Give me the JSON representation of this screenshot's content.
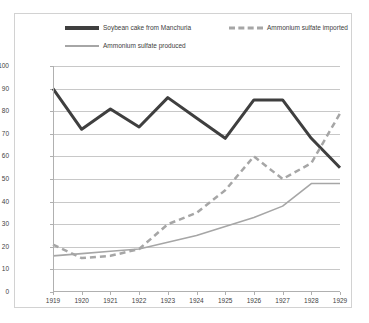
{
  "legend": {
    "entries": [
      {
        "label": "Soybean cake from Manchuria",
        "style": "solid-dark",
        "color": "#3f3f3f"
      },
      {
        "label": "Ammonium sulfate imported",
        "style": "dashed-gray",
        "color": "#a6a6a6"
      },
      {
        "label": "Ammonium sulfate produced",
        "style": "solid-gray",
        "color": "#a6a6a6"
      }
    ]
  },
  "chart_data": {
    "type": "line",
    "title": "",
    "xlabel": "",
    "ylabel": "",
    "categories": [
      "1919",
      "1920",
      "1921",
      "1922",
      "1923",
      "1924",
      "1925",
      "1926",
      "1927",
      "1928",
      "1929"
    ],
    "ylim": [
      0,
      100
    ],
    "yticks": [
      0,
      10,
      20,
      30,
      40,
      50,
      60,
      70,
      80,
      90,
      100
    ],
    "grid": true,
    "legend_position": "top",
    "series": [
      {
        "name": "Soybean cake from Manchuria",
        "color": "#3f3f3f",
        "style": "solid",
        "width": 3,
        "values": [
          90,
          72,
          81,
          73,
          86,
          77,
          68,
          85,
          85,
          68,
          55
        ]
      },
      {
        "name": "Ammonium sulfate imported",
        "color": "#a6a6a6",
        "style": "dashed",
        "width": 2.5,
        "values": [
          21,
          15,
          16,
          19,
          30,
          35,
          45,
          60,
          50,
          57,
          79
        ]
      },
      {
        "name": "Ammonium sulfate produced",
        "color": "#a6a6a6",
        "style": "solid",
        "width": 1.6,
        "values": [
          16,
          17,
          18,
          19,
          22,
          25,
          29,
          33,
          38,
          48,
          48
        ]
      }
    ]
  }
}
